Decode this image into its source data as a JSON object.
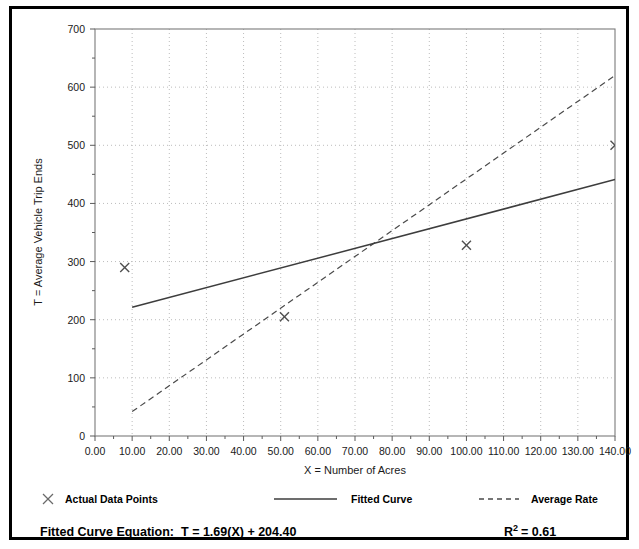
{
  "chart_data": {
    "type": "scatter",
    "title": "",
    "xlabel": "X = Number of Acres",
    "ylabel": "T = Average Vehicle Trip Ends",
    "xlim": [
      0,
      140
    ],
    "ylim": [
      0,
      700
    ],
    "grid": true,
    "x_ticks": [
      "0.00",
      "10.00",
      "20.00",
      "30.00",
      "40.00",
      "50.00",
      "60.00",
      "70.00",
      "80.00",
      "90.00",
      "100.00",
      "110.00",
      "120.00",
      "130.00",
      "140.00"
    ],
    "x_tick_values": [
      0,
      10,
      20,
      30,
      40,
      50,
      60,
      70,
      80,
      90,
      100,
      110,
      120,
      130,
      140
    ],
    "y_ticks": [
      "0",
      "100",
      "200",
      "300",
      "400",
      "500",
      "600",
      "700"
    ],
    "y_tick_values": [
      0,
      100,
      200,
      300,
      400,
      500,
      600,
      700
    ],
    "x_minor_step": 5,
    "y_minor_step": 50,
    "legend_position": "below-axis",
    "series": [
      {
        "name": "Actual Data Points",
        "type": "scatter",
        "marker": "x",
        "color": "#555555",
        "points": [
          {
            "x": 8,
            "y": 290
          },
          {
            "x": 51,
            "y": 205
          },
          {
            "x": 100,
            "y": 328
          },
          {
            "x": 140,
            "y": 500
          }
        ]
      },
      {
        "name": "Fitted Curve",
        "type": "line",
        "style": "solid",
        "color": "#444444",
        "equation": "T = 1.69(X) + 204.40",
        "slope": 1.69,
        "intercept": 204.4,
        "points": [
          {
            "x": 10,
            "y": 221.3
          },
          {
            "x": 140,
            "y": 441.0
          }
        ]
      },
      {
        "name": "Average Rate",
        "type": "line",
        "style": "dashed",
        "color": "#444444",
        "points": [
          {
            "x": 10,
            "y": 42
          },
          {
            "x": 140,
            "y": 620
          }
        ]
      }
    ],
    "annotations": [
      {
        "name": "fitted-curve-equation",
        "text": "Fitted Curve Equation:  T = 1.69(X) + 204.40"
      },
      {
        "name": "r-squared",
        "text": "R2 = 0.61",
        "value": 0.61
      }
    ]
  },
  "axes": {
    "x_label": "X = Number of Acres",
    "y_label": "T = Average Vehicle Trip Ends"
  },
  "legend": {
    "actual_data_points": "Actual Data Points",
    "fitted_curve": "Fitted Curve",
    "average_rate": "Average Rate"
  },
  "footer": {
    "equation_label": "Fitted Curve Equation:",
    "equation_value": "T = 1.69(X) + 204.40",
    "r_squared_base": "R",
    "r_squared_exp": "2",
    "r_squared_value": "= 0.61"
  },
  "ticks": {
    "x": [
      "0.00",
      "10.00",
      "20.00",
      "30.00",
      "40.00",
      "50.00",
      "60.00",
      "70.00",
      "80.00",
      "90.00",
      "100.00",
      "110.00",
      "120.00",
      "130.00",
      "140.00"
    ],
    "y": [
      "700",
      "600",
      "500",
      "400",
      "300",
      "200",
      "100",
      "0"
    ]
  },
  "colors": {
    "frame": "#000000",
    "axis": "#777777",
    "grid": "#b9b9b9",
    "line": "#444444",
    "marker": "#555555",
    "text": "#1a1a1a"
  }
}
